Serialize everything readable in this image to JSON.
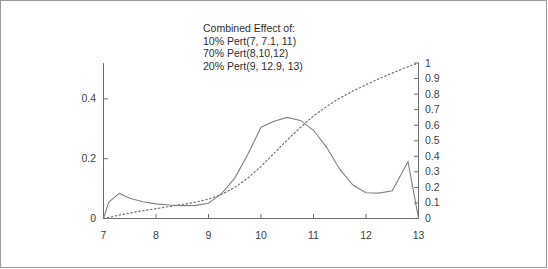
{
  "chart_data": {
    "type": "line",
    "title": "",
    "annotations": [
      "Combined Effect of:",
      "10% Pert(7, 7.1, 11)",
      "70% Pert(8,10,12)",
      "20% Pert(9, 12.9, 13)"
    ],
    "xlabel": "",
    "ylabel": "",
    "xlim": [
      7,
      13
    ],
    "xticks": [
      "7",
      "8",
      "9",
      "10",
      "11",
      "12",
      "13"
    ],
    "left_axis": {
      "ylim": [
        0,
        0.52
      ],
      "ticks": [
        "0",
        "0.2",
        "0.4"
      ],
      "tick_values": [
        0,
        0.2,
        0.4
      ]
    },
    "right_axis": {
      "ylim": [
        0,
        1
      ],
      "ticks": [
        "0",
        "0.1",
        "0.2",
        "0.3",
        "0.4",
        "0.5",
        "0.6",
        "0.7",
        "0.8",
        "0.9",
        "1"
      ],
      "tick_values": [
        0,
        0.1,
        0.2,
        0.3,
        0.4,
        0.5,
        0.6,
        0.7,
        0.8,
        0.9,
        1
      ]
    },
    "grid": false,
    "legend_position": "top-center",
    "series": [
      {
        "name": "density",
        "style": "solid",
        "axis": "left",
        "color": "#808080",
        "x": [
          7.0,
          7.1,
          7.3,
          7.5,
          7.75,
          8.0,
          8.25,
          8.5,
          8.75,
          9.0,
          9.25,
          9.5,
          9.75,
          10.0,
          10.25,
          10.5,
          10.75,
          11.0,
          11.25,
          11.5,
          11.75,
          12.0,
          12.25,
          12.5,
          12.8,
          13.0
        ],
        "y": [
          0.0,
          0.055,
          0.084,
          0.068,
          0.056,
          0.049,
          0.045,
          0.043,
          0.044,
          0.051,
          0.083,
          0.135,
          0.215,
          0.305,
          0.325,
          0.338,
          0.328,
          0.295,
          0.238,
          0.165,
          0.112,
          0.086,
          0.085,
          0.093,
          0.19,
          0.0
        ]
      },
      {
        "name": "cumulative",
        "style": "dotted",
        "axis": "right",
        "color": "#707070",
        "x": [
          7.0,
          7.25,
          7.5,
          7.75,
          8.0,
          8.25,
          8.5,
          8.75,
          9.0,
          9.25,
          9.5,
          9.75,
          10.0,
          10.25,
          10.5,
          10.75,
          11.0,
          11.25,
          11.5,
          11.75,
          12.0,
          12.25,
          12.5,
          12.75,
          13.0
        ],
        "y": [
          0.0,
          0.018,
          0.035,
          0.05,
          0.063,
          0.077,
          0.09,
          0.105,
          0.125,
          0.155,
          0.2,
          0.26,
          0.335,
          0.42,
          0.505,
          0.585,
          0.66,
          0.72,
          0.775,
          0.82,
          0.86,
          0.9,
          0.935,
          0.97,
          1.0
        ]
      }
    ]
  }
}
